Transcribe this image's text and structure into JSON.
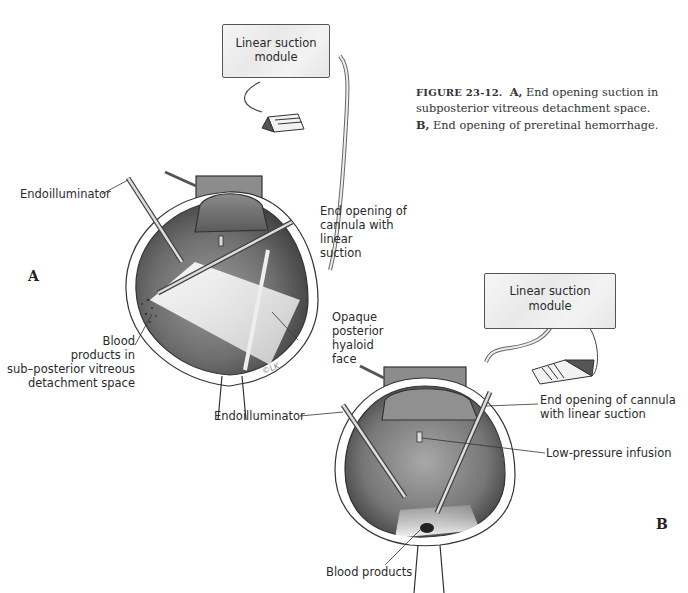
{
  "figure": {
    "number_label": "FIGURE 23-12.",
    "caption_a_letter": "A,",
    "caption_a_text": "End opening suction in subposterior vitreous detachment space.",
    "caption_b_letter": "B,",
    "caption_b_text": "End opening of preretinal hemorrhage."
  },
  "panel_a": {
    "letter": "A",
    "module_label_line1": "Linear suction",
    "module_label_line2": "module",
    "labels": {
      "endoilluminator": "Endoilluminator",
      "cannula_line1": "End opening of",
      "cannula_line2": "cannula with",
      "cannula_line3": "linear",
      "cannula_line4": "suction",
      "blood_line1": "Blood",
      "blood_line2": "products in",
      "blood_line3": "sub–posterior vitreous",
      "blood_line4": "detachment space",
      "hyaloid_line1": "Opaque",
      "hyaloid_line2": "posterior",
      "hyaloid_line3": "hyaloid",
      "hyaloid_line4": "face",
      "signature": "©LK"
    }
  },
  "panel_b": {
    "letter": "B",
    "module_label_line1": "Linear suction",
    "module_label_line2": "module",
    "labels": {
      "endoilluminator": "Endoilluminator",
      "cannula_line1": "End opening of cannula",
      "cannula_line2": "with linear suction",
      "infusion": "Low-pressure infusion",
      "blood": "Blood products"
    }
  },
  "colors": {
    "line": "#333333",
    "module_fill": "#efefef",
    "vitreous_dark": "#5a5a5a",
    "light_cone": "#f2f2f2"
  }
}
